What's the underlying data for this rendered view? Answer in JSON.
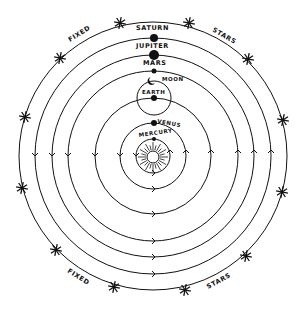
{
  "diagram": {
    "type": "heliocentric-solar-system",
    "center": {
      "x": 153,
      "y": 156
    },
    "sun": {
      "name": "sun-icon",
      "x": 153,
      "y": 157,
      "r": 6,
      "rays": 24
    },
    "orbits": [
      {
        "name": "mercury",
        "label": "MERCURY",
        "r": 17,
        "planet_r": 2
      },
      {
        "name": "venus",
        "label": "VENUS",
        "r": 33,
        "planet_r": 3
      },
      {
        "name": "earth",
        "label": "EARTH",
        "r": 58,
        "planet_r": 3
      },
      {
        "name": "mars",
        "label": "MARS",
        "r": 85,
        "planet_r": 2.5
      },
      {
        "name": "jupiter",
        "label": "JUPITER",
        "r": 101,
        "planet_r": 5
      },
      {
        "name": "saturn",
        "label": "SATURN",
        "r": 118,
        "planet_r": 4
      },
      {
        "name": "fixed-stars",
        "label": "",
        "r": 134,
        "planet_r": 0
      }
    ],
    "moon": {
      "label": "MOON",
      "orbit_r": 17
    },
    "fixed_stars_labels": [
      "FIXED",
      "STARS",
      "FIXED",
      "STARS"
    ],
    "stars": [
      [
        120,
        23
      ],
      [
        189,
        23
      ],
      [
        60,
        58
      ],
      [
        248,
        59
      ],
      [
        25,
        117
      ],
      [
        283,
        120
      ],
      [
        22,
        188
      ],
      [
        282,
        192
      ],
      [
        56,
        250
      ],
      [
        246,
        256
      ],
      [
        114,
        287
      ],
      [
        185,
        290
      ]
    ]
  }
}
